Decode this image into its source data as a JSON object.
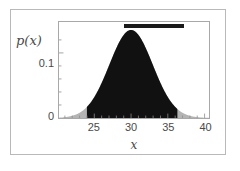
{
  "figure": {
    "kind": "probability-density-plot",
    "background": "#ffffff",
    "outer_border_color": "#b9b9b9",
    "axes_border_color": "#a8a8a8"
  },
  "axes": {
    "y_axis_title": "p(x)",
    "x_axis_title": "x",
    "y_ticks": [
      {
        "value": 0,
        "label": "0"
      },
      {
        "value": 0.1,
        "label": "0.1"
      }
    ],
    "x_ticks": [
      {
        "value": 25,
        "label": "25"
      },
      {
        "value": 30,
        "label": "30"
      },
      {
        "value": 35,
        "label": "35"
      },
      {
        "value": 40,
        "label": "40"
      }
    ],
    "x_minor_ticks": [
      21,
      22,
      23,
      24,
      26,
      27,
      28,
      29,
      31,
      32,
      33,
      34,
      36,
      37,
      38,
      39
    ],
    "y_minor_ticks": [
      0.02,
      0.04,
      0.06,
      0.08,
      0.12
    ],
    "xlim": [
      20.2,
      40.6
    ],
    "ylim": [
      0,
      0.1475
    ],
    "tick_color": "#8c8c8c",
    "label_color": "#4a4a4a"
  },
  "chart_data": {
    "type": "area",
    "title": "",
    "subtitle": "",
    "xlabel": "x",
    "ylabel": "p(x)",
    "xlim": [
      20.2,
      40.6
    ],
    "ylim": [
      0,
      0.1475
    ],
    "grid": false,
    "legend": null,
    "curve": {
      "name": "normal density",
      "distribution": "normal",
      "mean": 30,
      "sigma": 2.95,
      "peak_value": 0.1352,
      "fill_light": "#b4b4b4",
      "fill_dark": "#111111",
      "x": [
        20.2,
        21,
        22,
        23,
        24,
        25,
        26,
        27,
        28,
        29,
        30,
        31,
        32,
        33,
        34,
        35,
        36,
        37,
        38,
        39,
        40,
        40.6
      ],
      "y": [
        0.0008,
        0.0022,
        0.0061,
        0.0142,
        0.0281,
        0.0472,
        0.0674,
        0.0818,
        0.0841,
        0.1252,
        0.1352,
        0.1252,
        0.0841,
        0.0818,
        0.0674,
        0.0472,
        0.0281,
        0.0142,
        0.0061,
        0.0022,
        0.0007,
        0.0004
      ]
    },
    "shaded_interval": {
      "name": "highlighted credible interval",
      "x_start": 24.0,
      "x_end": 36.3,
      "color": "#111111"
    },
    "annotations": [
      {
        "kind": "interval-bar",
        "name": "interval-marker-bar",
        "x_start": 29.0,
        "x_end": 37.1,
        "y": 0.1405,
        "color": "#1a1a1a",
        "thickness_px": 4
      }
    ]
  }
}
